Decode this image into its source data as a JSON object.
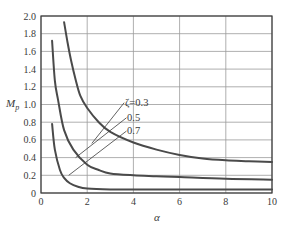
{
  "chart_data": {
    "type": "line",
    "title": "",
    "xlabel": "α",
    "ylabel": "M_p",
    "xlim": [
      0,
      10
    ],
    "ylim": [
      0,
      2.0
    ],
    "grid": true,
    "x_ticks": [
      0,
      2,
      4,
      6,
      8,
      10
    ],
    "x_tick_labels": [
      "0",
      "2",
      "4",
      "6",
      "8",
      "10"
    ],
    "y_ticks": [
      0,
      0.2,
      0.4,
      0.6,
      0.8,
      1.0,
      1.2,
      1.4,
      1.6,
      1.8,
      2.0
    ],
    "y_tick_labels": [
      "0",
      "0.2",
      "0.4",
      "0.6",
      "0.8",
      "1.0",
      "1.2",
      "1.4",
      "1.6",
      "1.8",
      "2.0"
    ],
    "legend_position": "inline annotations with leader lines",
    "series": [
      {
        "name": "ζ=0.3",
        "label": "ζ=0.3",
        "x": [
          1.0,
          1.15,
          1.3,
          1.5,
          1.7,
          2.0,
          2.5,
          3.0,
          4.0,
          5.0,
          6.0,
          7.0,
          8.0,
          9.0,
          10.0
        ],
        "values": [
          1.93,
          1.7,
          1.5,
          1.28,
          1.1,
          0.96,
          0.8,
          0.69,
          0.57,
          0.49,
          0.43,
          0.39,
          0.37,
          0.36,
          0.35
        ]
      },
      {
        "name": "ζ=0.5",
        "label": "0.5",
        "x": [
          0.48,
          0.6,
          0.74,
          1.0,
          1.4,
          2.0,
          2.5,
          3.0,
          4.0,
          5.0,
          6.0,
          8.0,
          10.0
        ],
        "values": [
          1.72,
          1.27,
          1.05,
          0.71,
          0.49,
          0.32,
          0.26,
          0.22,
          0.2,
          0.19,
          0.18,
          0.16,
          0.15
        ]
      },
      {
        "name": "ζ=0.7",
        "label": "0.7",
        "x": [
          0.48,
          0.6,
          0.82,
          1.0,
          1.25,
          1.6,
          2.0,
          3.0,
          4.0,
          6.0,
          8.0,
          10.0
        ],
        "values": [
          0.78,
          0.49,
          0.26,
          0.17,
          0.11,
          0.07,
          0.05,
          0.04,
          0.04,
          0.04,
          0.04,
          0.04
        ]
      }
    ],
    "annotations": [
      {
        "text": "ζ=0.3",
        "leader_from": [
          2.2,
          0.56
        ],
        "leader_to": [
          3.6,
          1.02
        ]
      },
      {
        "text": "0.5",
        "leader_from": [
          1.5,
          0.4
        ],
        "leader_to": [
          3.7,
          0.85
        ]
      },
      {
        "text": "0.7",
        "leader_from": [
          1.2,
          0.2
        ],
        "leader_to": [
          3.7,
          0.7
        ]
      }
    ]
  },
  "labels": {
    "ylabel_main": "M",
    "ylabel_sub": "p",
    "xlabel": "α",
    "annot_03": "ζ=0.3",
    "annot_05": "0.5",
    "annot_07": "0.7"
  },
  "colors": {
    "curve": "#4a4a4a",
    "grid": "#9a9a9a",
    "frame": "#3a3a3a",
    "text": "#3a3a3a"
  }
}
